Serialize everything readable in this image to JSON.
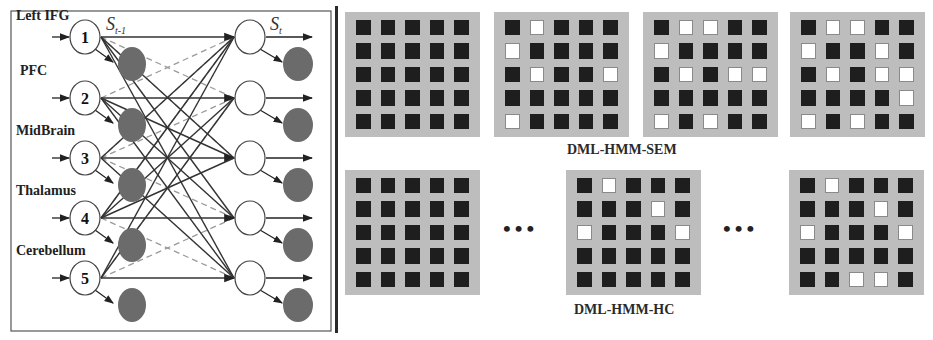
{
  "network": {
    "regions": [
      "Left IFG",
      "PFC",
      "MidBrain",
      "Thalamus",
      "Cerebellum"
    ],
    "node_ids": [
      "1",
      "2",
      "3",
      "4",
      "5"
    ],
    "state_prev_label": "S",
    "state_prev_sub": "t-1",
    "state_curr_label": "S",
    "state_curr_sub": "t",
    "colors": {
      "hidden_node_fill": "#ffffff",
      "observed_node_fill": "#6b6b6b",
      "solid_edge": "#333333",
      "dashed_edge": "#9a9a9a"
    }
  },
  "panels": {
    "sem": {
      "label": "DML-HMM-SEM",
      "matrices": [
        [
          [
            0,
            0,
            0,
            0,
            0
          ],
          [
            0,
            0,
            0,
            0,
            0
          ],
          [
            0,
            0,
            0,
            0,
            0
          ],
          [
            0,
            0,
            0,
            0,
            0
          ],
          [
            0,
            0,
            0,
            0,
            0
          ]
        ],
        [
          [
            0,
            1,
            0,
            0,
            0
          ],
          [
            1,
            0,
            0,
            0,
            0
          ],
          [
            0,
            1,
            0,
            0,
            1
          ],
          [
            0,
            0,
            0,
            0,
            0
          ],
          [
            1,
            0,
            0,
            0,
            0
          ]
        ],
        [
          [
            0,
            1,
            1,
            0,
            0
          ],
          [
            1,
            0,
            0,
            0,
            0
          ],
          [
            0,
            1,
            0,
            1,
            1
          ],
          [
            0,
            0,
            0,
            0,
            0
          ],
          [
            1,
            0,
            1,
            0,
            0
          ]
        ],
        [
          [
            0,
            1,
            1,
            0,
            0
          ],
          [
            1,
            0,
            0,
            1,
            0
          ],
          [
            0,
            1,
            0,
            1,
            1
          ],
          [
            0,
            0,
            0,
            0,
            1
          ],
          [
            1,
            0,
            1,
            0,
            0
          ]
        ]
      ]
    },
    "hc": {
      "label": "DML-HMM-HC",
      "ellipsis": "•••",
      "matrices": [
        [
          [
            0,
            0,
            0,
            0,
            0
          ],
          [
            0,
            0,
            0,
            0,
            0
          ],
          [
            0,
            0,
            0,
            0,
            0
          ],
          [
            0,
            0,
            0,
            0,
            0
          ],
          [
            0,
            0,
            0,
            0,
            0
          ]
        ],
        [
          [
            0,
            1,
            0,
            0,
            0
          ],
          [
            0,
            0,
            0,
            1,
            0
          ],
          [
            1,
            0,
            0,
            0,
            1
          ],
          [
            0,
            0,
            0,
            0,
            0
          ],
          [
            0,
            0,
            0,
            0,
            0
          ]
        ],
        [
          [
            0,
            1,
            0,
            0,
            0
          ],
          [
            0,
            0,
            0,
            1,
            0
          ],
          [
            1,
            0,
            0,
            0,
            1
          ],
          [
            0,
            0,
            0,
            0,
            0
          ],
          [
            0,
            0,
            1,
            1,
            0
          ]
        ]
      ]
    }
  },
  "colors": {
    "matrix_bg": "#bdbdbd",
    "cell_off": "#1e1e1e",
    "cell_on": "#ffffff",
    "divider": "#2a2a2a"
  }
}
